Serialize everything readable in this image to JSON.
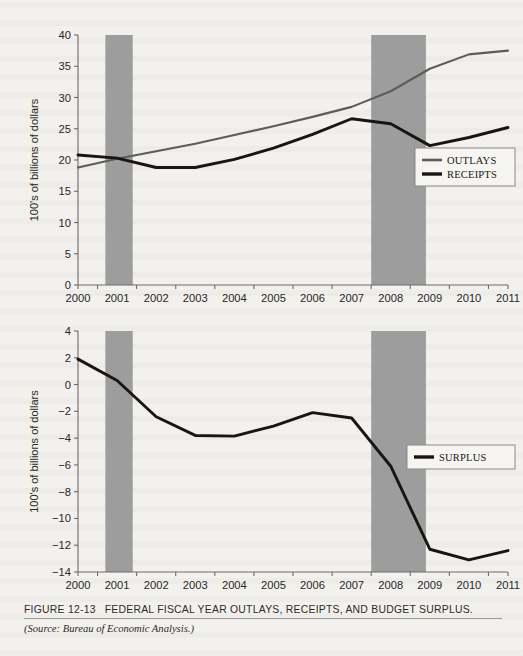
{
  "figure": {
    "number_label": "FIGURE 12-13",
    "title": "FEDERAL FISCAL YEAR OUTLAYS, RECEIPTS, AND BUDGET SURPLUS.",
    "source": "(Source: Bureau of Economic Analysis.)"
  },
  "chart_data": [
    {
      "type": "line",
      "id": "outlays-receipts",
      "title": "",
      "xlabel": "",
      "ylabel": "100's of billions of dollars",
      "x": [
        2000,
        2001,
        2002,
        2003,
        2004,
        2005,
        2006,
        2007,
        2008,
        2009,
        2010,
        2011
      ],
      "categories": [
        "2000",
        "2001",
        "2002",
        "2003",
        "2004",
        "2005",
        "2006",
        "2007",
        "2008",
        "2009",
        "2010",
        "2011"
      ],
      "xlim": [
        2000,
        2011
      ],
      "ylim": [
        0,
        40
      ],
      "yticks": [
        0,
        5,
        10,
        15,
        20,
        25,
        30,
        35,
        40
      ],
      "ytick_labels": [
        "0",
        "5",
        "10",
        "15",
        "20",
        "25",
        "30",
        "35",
        "40"
      ],
      "grid": false,
      "legend_position": "right",
      "series": [
        {
          "name": "OUTLAYS",
          "color": "#5e5c5a",
          "values": [
            18.8,
            20.2,
            21.4,
            22.6,
            24.0,
            25.4,
            26.9,
            28.5,
            31.0,
            34.6,
            36.9,
            37.5
          ]
        },
        {
          "name": "RECEIPTS",
          "color": "#181513",
          "values": [
            20.8,
            20.3,
            18.8,
            18.8,
            20.1,
            21.9,
            24.1,
            26.6,
            25.8,
            22.3,
            23.6,
            25.2
          ]
        }
      ],
      "shaded_bands": [
        {
          "name": "recession-2001",
          "x_start": 2000.7,
          "x_end": 2001.4,
          "color": "#9d9d9d"
        },
        {
          "name": "recession-2008",
          "x_start": 2007.5,
          "x_end": 2008.9,
          "color": "#9d9d9d"
        }
      ]
    },
    {
      "type": "line",
      "id": "surplus",
      "title": "",
      "xlabel": "",
      "ylabel": "100's of billions of dollars",
      "x": [
        2000,
        2001,
        2002,
        2003,
        2004,
        2005,
        2006,
        2007,
        2008,
        2009,
        2010,
        2011
      ],
      "categories": [
        "2000",
        "2001",
        "2002",
        "2003",
        "2004",
        "2005",
        "2006",
        "2007",
        "2008",
        "2009",
        "2010",
        "2011"
      ],
      "xlim": [
        2000,
        2011
      ],
      "ylim": [
        -14,
        4
      ],
      "yticks": [
        -14,
        -12,
        -10,
        -8,
        -6,
        -4,
        -2,
        0,
        2,
        4
      ],
      "ytick_labels": [
        "−14",
        "−12",
        "−10",
        "−8",
        "−6",
        "−4",
        "−2",
        "0",
        "2",
        "4"
      ],
      "grid": false,
      "legend_position": "right",
      "series": [
        {
          "name": "SURPLUS",
          "color": "#181513",
          "values": [
            1.9,
            0.3,
            -2.4,
            -3.8,
            -3.85,
            -3.1,
            -2.1,
            -2.5,
            -6.1,
            -12.3,
            -13.1,
            -12.4
          ]
        }
      ],
      "shaded_bands": [
        {
          "name": "recession-2001",
          "x_start": 2000.7,
          "x_end": 2001.4,
          "color": "#9d9d9d"
        },
        {
          "name": "recession-2008",
          "x_start": 2007.5,
          "x_end": 2008.9,
          "color": "#9d9d9d"
        }
      ]
    }
  ]
}
